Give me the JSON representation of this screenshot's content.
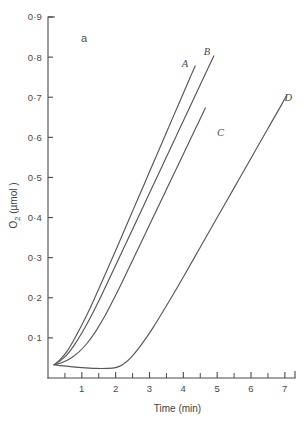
{
  "figure": {
    "panel_label": "a",
    "background_color": "#ffffff",
    "line_color": "#56565c",
    "axis_color": "#4a4a4a"
  },
  "axes": {
    "y": {
      "title_main": "O",
      "title_sub": "2",
      "title_unit": " (µmol )",
      "title_full": "O2 (µmol )",
      "tick_labels": [
        "0·9",
        "0·8",
        "0·7",
        "0·6",
        "0·5",
        "0·4",
        "0·3",
        "0·2",
        "0·1"
      ],
      "tick_values": [
        0.9,
        0.8,
        0.7,
        0.6,
        0.5,
        0.4,
        0.3,
        0.2,
        0.1
      ],
      "min": 0.0,
      "max": 0.9
    },
    "x": {
      "title": "Time (min)",
      "tick_labels": [
        "1",
        "2",
        "3",
        "4",
        "5",
        "6",
        "7"
      ],
      "tick_values": [
        1,
        2,
        3,
        4,
        5,
        6,
        7
      ],
      "minor_tick_values": [
        0.5,
        1.5,
        2.5,
        3.5,
        4.5,
        5.5,
        6.5
      ],
      "min": 0,
      "max": 7.3
    }
  },
  "chart_data": {
    "type": "line",
    "title": "",
    "subtitle": "a",
    "xlabel": "Time (min)",
    "ylabel": "O2 (µmol )",
    "xlim": [
      0,
      7.3
    ],
    "ylim": [
      0,
      0.9
    ],
    "grid": false,
    "legend": "inline-end-labels",
    "x_tick_labels": [
      "1",
      "2",
      "3",
      "4",
      "5",
      "6",
      "7"
    ],
    "y_tick_labels": [
      "0·1",
      "0·2",
      "0·3",
      "0·4",
      "0·5",
      "0·6",
      "0·7",
      "0·8",
      "0·9"
    ],
    "series": [
      {
        "name": "A",
        "label": "A",
        "label_x": 4.05,
        "label_y": 0.775,
        "points": [
          [
            0.18,
            0.033
          ],
          [
            0.35,
            0.045
          ],
          [
            0.55,
            0.065
          ],
          [
            0.75,
            0.093
          ],
          [
            1.0,
            0.132
          ],
          [
            1.25,
            0.175
          ],
          [
            1.5,
            0.222
          ],
          [
            1.75,
            0.27
          ],
          [
            2.0,
            0.318
          ],
          [
            2.25,
            0.367
          ],
          [
            2.5,
            0.416
          ],
          [
            2.75,
            0.465
          ],
          [
            3.0,
            0.514
          ],
          [
            3.25,
            0.563
          ],
          [
            3.5,
            0.612
          ],
          [
            3.75,
            0.661
          ],
          [
            4.0,
            0.71
          ],
          [
            4.2,
            0.749
          ],
          [
            4.35,
            0.778
          ]
        ]
      },
      {
        "name": "B",
        "label": "B",
        "label_x": 4.7,
        "label_y": 0.805,
        "points": [
          [
            0.18,
            0.033
          ],
          [
            0.35,
            0.042
          ],
          [
            0.55,
            0.057
          ],
          [
            0.75,
            0.079
          ],
          [
            1.0,
            0.112
          ],
          [
            1.25,
            0.15
          ],
          [
            1.5,
            0.192
          ],
          [
            1.75,
            0.236
          ],
          [
            2.0,
            0.281
          ],
          [
            2.25,
            0.326
          ],
          [
            2.5,
            0.371
          ],
          [
            2.75,
            0.416
          ],
          [
            3.0,
            0.461
          ],
          [
            3.3,
            0.515
          ],
          [
            3.6,
            0.569
          ],
          [
            3.9,
            0.623
          ],
          [
            4.2,
            0.677
          ],
          [
            4.5,
            0.731
          ],
          [
            4.75,
            0.776
          ],
          [
            4.9,
            0.803
          ]
        ]
      },
      {
        "name": "C",
        "label": "C",
        "label_x": 5.1,
        "label_y": 0.603,
        "points": [
          [
            0.18,
            0.033
          ],
          [
            0.4,
            0.038
          ],
          [
            0.65,
            0.048
          ],
          [
            0.9,
            0.064
          ],
          [
            1.15,
            0.086
          ],
          [
            1.4,
            0.115
          ],
          [
            1.65,
            0.15
          ],
          [
            1.9,
            0.19
          ],
          [
            2.15,
            0.232
          ],
          [
            2.4,
            0.276
          ],
          [
            2.65,
            0.32
          ],
          [
            2.9,
            0.364
          ],
          [
            3.2,
            0.417
          ],
          [
            3.5,
            0.47
          ],
          [
            3.8,
            0.523
          ],
          [
            4.1,
            0.576
          ],
          [
            4.4,
            0.629
          ],
          [
            4.65,
            0.673
          ]
        ]
      },
      {
        "name": "D",
        "label": "D",
        "label_x": 7.1,
        "label_y": 0.69,
        "points": [
          [
            0.18,
            0.033
          ],
          [
            0.6,
            0.029
          ],
          [
            1.0,
            0.026
          ],
          [
            1.4,
            0.024
          ],
          [
            1.75,
            0.024
          ],
          [
            2.0,
            0.026
          ],
          [
            2.2,
            0.033
          ],
          [
            2.45,
            0.051
          ],
          [
            2.75,
            0.082
          ],
          [
            3.1,
            0.125
          ],
          [
            3.5,
            0.18
          ],
          [
            4.0,
            0.252
          ],
          [
            4.5,
            0.326
          ],
          [
            5.0,
            0.4
          ],
          [
            5.5,
            0.474
          ],
          [
            6.0,
            0.548
          ],
          [
            6.5,
            0.622
          ],
          [
            6.9,
            0.681
          ],
          [
            7.05,
            0.704
          ]
        ]
      }
    ]
  }
}
